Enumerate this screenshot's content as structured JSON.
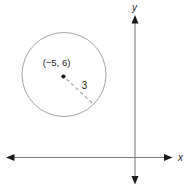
{
  "figure": {
    "background": "#ffffff",
    "axes": {
      "x_label": "x",
      "y_label": "y",
      "line_color": "#7d7d7d",
      "arrow_color": "#1b1b1b",
      "label_color": "#2b2b2b"
    },
    "circle": {
      "center_label": "(−5, 6)",
      "center": {
        "x": -5,
        "y": 6
      },
      "radius": 3,
      "radius_label": "3",
      "outline_color": "#a5a5a5",
      "dashed_line_color": "#9c9c9c",
      "point_color": "#141414",
      "label_color": "#202020"
    }
  }
}
